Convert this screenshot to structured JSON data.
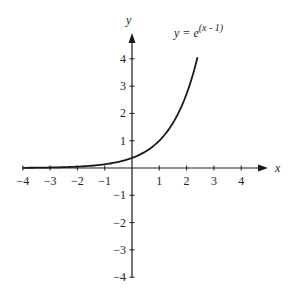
{
  "chart_data": {
    "type": "line",
    "title": "",
    "annotation": "y = e^(x - 1)",
    "annotation_parts": {
      "lhs": "y = e",
      "exponent": "(x - 1)"
    },
    "xlabel": "x",
    "ylabel": "y",
    "xlim": [
      -4,
      4
    ],
    "ylim": [
      -4,
      4
    ],
    "x_ticks": [
      -4,
      -3,
      -2,
      -1,
      1,
      2,
      3,
      4
    ],
    "y_ticks": [
      -4,
      -3,
      -2,
      -1,
      1,
      2,
      3,
      4
    ],
    "x_tick_labels": [
      "−4",
      "−3",
      "−2",
      "−1",
      "1",
      "2",
      "3",
      "4"
    ],
    "y_tick_labels": [
      "−4",
      "−3",
      "−2",
      "−1",
      "1",
      "2",
      "3",
      "4"
    ],
    "grid": false,
    "legend": "none",
    "series": [
      {
        "name": "y = e^(x - 1)",
        "function": "exp(x - 1)",
        "x_range": [
          -4,
          2.4
        ],
        "x": [
          -4,
          -3,
          -2,
          -1,
          0,
          0.5,
          1,
          1.5,
          2,
          2.4
        ],
        "y": [
          0.007,
          0.018,
          0.05,
          0.135,
          0.368,
          0.607,
          1.0,
          1.649,
          2.718,
          4.055
        ]
      }
    ],
    "colors": {
      "line": "#1a1a1a",
      "axis": "#1a1a1a",
      "text": "#222222"
    }
  }
}
